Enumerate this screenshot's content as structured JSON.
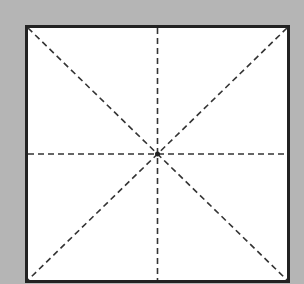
{
  "diagram": {
    "type": "square-grid-guide",
    "colors": {
      "background": "#b5b5b5",
      "fill": "#ffffff",
      "border": "#222222",
      "guides": "#333333"
    },
    "square": {
      "x": 26.5,
      "y": 26.5,
      "width": 262,
      "height": 255,
      "border_width": 3
    },
    "center": {
      "x": 157.5,
      "y": 154
    },
    "guides": [
      {
        "name": "vertical-center-line",
        "style": "dashed"
      },
      {
        "name": "horizontal-center-line",
        "style": "dashed"
      },
      {
        "name": "diagonal-tl-br",
        "style": "dashed"
      },
      {
        "name": "diagonal-tr-bl",
        "style": "dashed"
      }
    ],
    "center_dot": true
  }
}
